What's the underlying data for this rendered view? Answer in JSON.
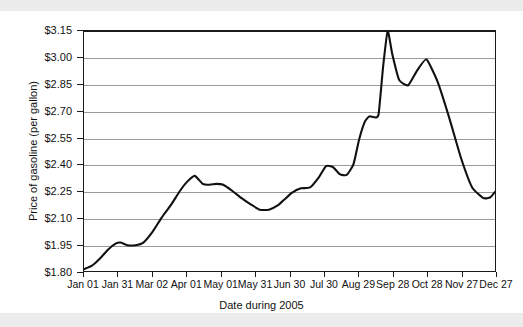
{
  "chart_data": {
    "type": "line",
    "title": "",
    "xlabel": "Date during 2005",
    "ylabel": "Price of gasoline (per gallon)",
    "ylim": [
      1.8,
      3.15
    ],
    "ytick_values": [
      1.8,
      1.95,
      2.1,
      2.25,
      2.4,
      2.55,
      2.7,
      2.85,
      3.0,
      3.15
    ],
    "ytick_labels": [
      "$1.80",
      "$1.95",
      "$2.10",
      "$2.25",
      "$2.40",
      "$2.55",
      "$2.70",
      "$2.85",
      "$3.00",
      "$3.15"
    ],
    "xtick_labels": [
      "Jan 01",
      "Jan 31",
      "Mar 02",
      "Apr 01",
      "May 01",
      "May 31",
      "Jun 30",
      "Jul 30",
      "Aug 29",
      "Sep 28",
      "Oct 28",
      "Nov 27",
      "Dec 27"
    ],
    "xlim_days": [
      0,
      360
    ],
    "xtick_days": [
      0,
      30,
      60,
      90,
      120,
      150,
      180,
      210,
      240,
      270,
      300,
      330,
      360
    ],
    "grid": "horizontal",
    "legend": "none",
    "line_color": "#111111",
    "series": [
      {
        "name": "Price of gasoline",
        "x_days": [
          0,
          7,
          14,
          21,
          28,
          32,
          38,
          45,
          52,
          60,
          68,
          76,
          84,
          90,
          97,
          104,
          110,
          116,
          122,
          130,
          138,
          146,
          154,
          162,
          170,
          176,
          182,
          190,
          198,
          206,
          212,
          218,
          224,
          230,
          236,
          241,
          246,
          250,
          254,
          258,
          262,
          266,
          270,
          276,
          284,
          292,
          300,
          310,
          320,
          330,
          340,
          350,
          356,
          360
        ],
        "values": [
          1.81,
          1.83,
          1.87,
          1.92,
          1.955,
          1.96,
          1.945,
          1.945,
          1.96,
          2.02,
          2.1,
          2.17,
          2.25,
          2.3,
          2.335,
          2.29,
          2.285,
          2.29,
          2.285,
          2.25,
          2.21,
          2.175,
          2.145,
          2.145,
          2.17,
          2.205,
          2.24,
          2.265,
          2.27,
          2.33,
          2.39,
          2.385,
          2.345,
          2.34,
          2.4,
          2.54,
          2.64,
          2.67,
          2.665,
          2.68,
          2.95,
          3.15,
          3.02,
          2.875,
          2.845,
          2.93,
          2.99,
          2.86,
          2.66,
          2.44,
          2.27,
          2.21,
          2.215,
          2.245
        ]
      }
    ]
  },
  "axes": {
    "y_title": "Price of gasoline (per gallon)",
    "x_title": "Date during 2005"
  }
}
